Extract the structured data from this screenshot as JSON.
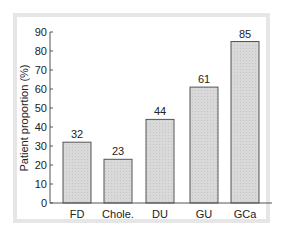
{
  "chart_data": {
    "type": "bar",
    "title": "",
    "xlabel": "",
    "ylabel": "Patient proportion (%)",
    "categories": [
      "FD",
      "Chole.",
      "DU",
      "GU",
      "GCa"
    ],
    "values": [
      32,
      23,
      44,
      61,
      85
    ],
    "data_labels": [
      "32",
      "23",
      "44",
      "61",
      "85"
    ],
    "ylim": [
      0,
      90
    ],
    "yticks": [
      0,
      10,
      20,
      30,
      40,
      50,
      60,
      70,
      80,
      90
    ],
    "grid": false,
    "legend": null,
    "bar_fill": "#d9d9d9",
    "bar_stroke": "#555555"
  }
}
